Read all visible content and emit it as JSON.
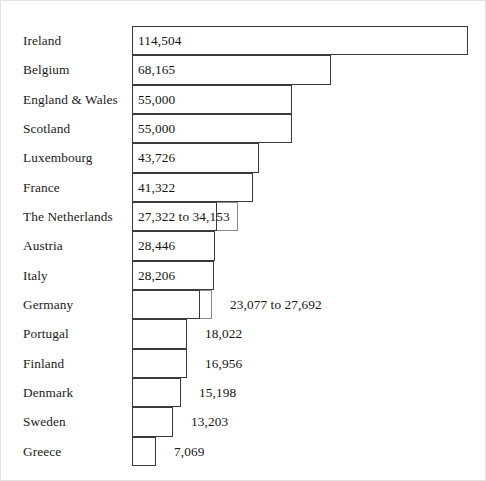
{
  "chart_data": {
    "type": "bar",
    "orientation": "horizontal",
    "title": "",
    "xlabel": "",
    "ylabel": "",
    "grid": false,
    "legend": null,
    "axis_visible": false,
    "xlim": [
      0,
      120000
    ],
    "value_label_format": "thousands-comma",
    "categories": [
      "Ireland",
      "Belgium",
      "England & Wales",
      "Scotland",
      "Luxembourg",
      "France",
      "The Netherlands",
      "Austria",
      "Italy",
      "Germany",
      "Portugal",
      "Finland",
      "Denmark",
      "Sweden",
      "Greece"
    ],
    "values": [
      114504,
      68165,
      55000,
      55000,
      43726,
      41322,
      30737,
      28446,
      28206,
      25384,
      18022,
      16956,
      15198,
      13203,
      7069
    ],
    "labels": [
      "114,504",
      "68,165",
      "55,000",
      "55,000",
      "43,726",
      "41,322",
      "27,322 to 34,153",
      "28,446",
      "28,206",
      "23,077 to 27,692",
      "18,022",
      "16,956",
      "15,198",
      "13,203",
      "7,069"
    ],
    "ranges": [
      null,
      null,
      null,
      null,
      null,
      null,
      [
        27322,
        34153
      ],
      null,
      null,
      [
        23077,
        27692
      ],
      null,
      null,
      null,
      null,
      null
    ],
    "bars": [
      {
        "category": "Ireland",
        "label": "114,504",
        "label_position": "inside",
        "x_start": 131,
        "x_end": 467,
        "inner_end": null
      },
      {
        "category": "Belgium",
        "label": "68,165",
        "label_position": "inside",
        "x_start": 131,
        "x_end": 330,
        "inner_end": null
      },
      {
        "category": "England & Wales",
        "label": "55,000",
        "label_position": "inside",
        "x_start": 131,
        "x_end": 291,
        "inner_end": null
      },
      {
        "category": "Scotland",
        "label": "55,000",
        "label_position": "inside",
        "x_start": 131,
        "x_end": 291,
        "inner_end": null
      },
      {
        "category": "Luxembourg",
        "label": "43,726",
        "label_position": "inside",
        "x_start": 131,
        "x_end": 258,
        "inner_end": null
      },
      {
        "category": "France",
        "label": "41,322",
        "label_position": "inside",
        "x_start": 131,
        "x_end": 252,
        "inner_end": null
      },
      {
        "category": "The Netherlands",
        "label": "27,322 to 34,153",
        "label_position": "inside",
        "x_start": 131,
        "x_end": 237,
        "inner_end": 216
      },
      {
        "category": "Austria",
        "label": "28,446",
        "label_position": "inside",
        "x_start": 131,
        "x_end": 214,
        "inner_end": null
      },
      {
        "category": "Italy",
        "label": "28,206",
        "label_position": "inside",
        "x_start": 131,
        "x_end": 213,
        "inner_end": null
      },
      {
        "category": "Germany",
        "label": "23,077 to 27,692",
        "label_position": "outside",
        "x_start": 131,
        "x_end": 211,
        "inner_end": 199
      },
      {
        "category": "Portugal",
        "label": "18,022",
        "label_position": "outside",
        "x_start": 131,
        "x_end": 186,
        "inner_end": null
      },
      {
        "category": "Finland",
        "label": "16,956",
        "label_position": "outside",
        "x_start": 131,
        "x_end": 186,
        "inner_end": null
      },
      {
        "category": "Denmark",
        "label": "15,198",
        "label_position": "outside",
        "x_start": 131,
        "x_end": 180,
        "inner_end": null
      },
      {
        "category": "Sweden",
        "label": "13,203",
        "label_position": "outside",
        "x_start": 131,
        "x_end": 172,
        "inner_end": null
      },
      {
        "category": "Greece",
        "label": "7,069",
        "label_position": "outside",
        "x_start": 131,
        "x_end": 155,
        "inner_end": null
      }
    ],
    "colors": {
      "background": "#ffffff",
      "bar_fill": "#ffffff",
      "bar_stroke": "#3a3a3a",
      "range_stroke": "#8a8a8a",
      "text": "#141414"
    },
    "geometry": {
      "row_height": 29.33,
      "first_row_top": 25,
      "bar_origin_x": 131,
      "label_x": 22,
      "inside_label_offset": 6,
      "outside_label_offset": 18
    }
  }
}
